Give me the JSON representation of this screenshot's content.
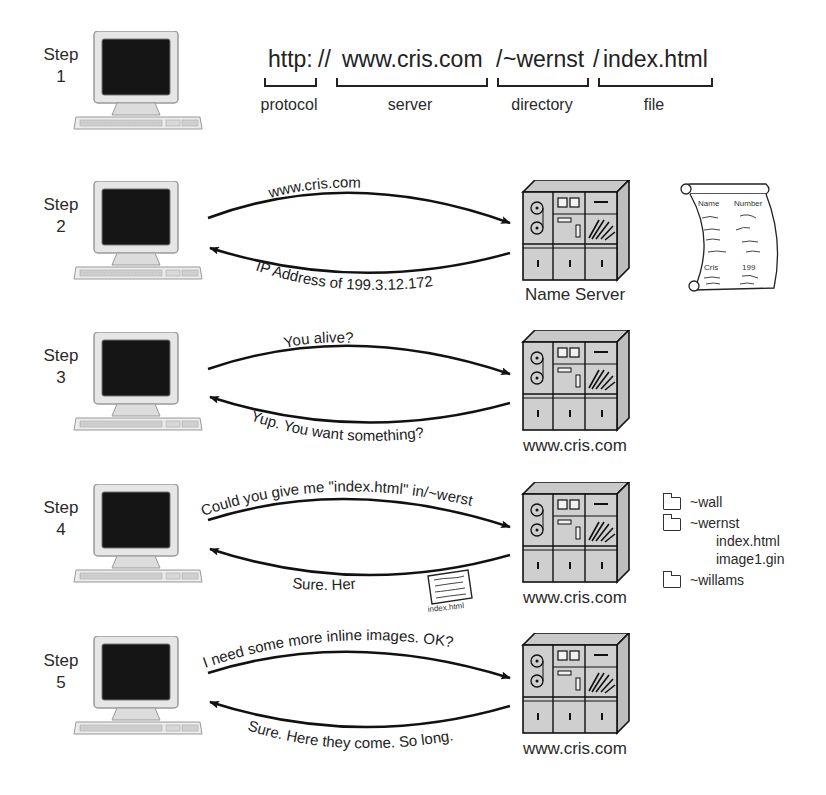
{
  "url_breakdown": {
    "parts": [
      {
        "text": "http:",
        "caption": "protocol"
      },
      {
        "text": "//",
        "caption": ""
      },
      {
        "text": "www.cris.com",
        "caption": "server"
      },
      {
        "text": "/",
        "caption": ""
      },
      {
        "text": "~wernst",
        "caption": "directory"
      },
      {
        "text": "/",
        "caption": ""
      },
      {
        "text": "index.html",
        "caption": "file"
      }
    ]
  },
  "steps": [
    {
      "label": "Step",
      "number": "1"
    },
    {
      "label": "Step",
      "number": "2",
      "request": "www.cris.com",
      "response": "IP Address of 199.3.12.172",
      "server": "Name Server"
    },
    {
      "label": "Step",
      "number": "3",
      "request": "You alive?",
      "response": "Yup. You want something?",
      "server": "www.cris.com"
    },
    {
      "label": "Step",
      "number": "4",
      "request": "Could you give me \"index.html\" in/~werst",
      "response": "Sure. Here it is.",
      "server": "www.cris.com",
      "document_label": "index.html"
    },
    {
      "label": "Step",
      "number": "5",
      "request": "I need some more inline images. OK?",
      "response": "Sure. Here they come. So long.",
      "server": "www.cris.com"
    }
  ],
  "name_table": {
    "headers": [
      "Name",
      "Number"
    ],
    "entry": {
      "name": "Cris",
      "number": "199"
    }
  },
  "directory_tree": [
    {
      "type": "folder",
      "name": "~wall"
    },
    {
      "type": "folder",
      "name": "~wernst"
    },
    {
      "type": "file",
      "name": "index.html"
    },
    {
      "type": "file",
      "name": "image1.gin"
    },
    {
      "type": "folder",
      "name": "~willams"
    }
  ]
}
